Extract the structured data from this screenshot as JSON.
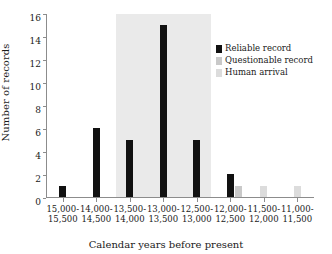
{
  "chart_data": {
    "type": "bar",
    "title": "",
    "subtitle": "",
    "xlabel": "Calendar years before present",
    "ylabel": "Number of records",
    "ylim": [
      0,
      16
    ],
    "ytick_labels": [
      "0",
      "2",
      "4",
      "6",
      "8",
      "10",
      "12",
      "14",
      "16"
    ],
    "ytick_values": [
      0,
      2,
      4,
      6,
      8,
      10,
      12,
      14,
      16
    ],
    "grid": false,
    "legend_position": "top-right",
    "categories": [
      "15,000-15,500",
      "14,000-14,500",
      "13,500-14,000",
      "13,000-13,500",
      "12,500-13,000",
      "12,000-12,500",
      "11,500-12,000",
      "11,000-11,500"
    ],
    "category_lines": [
      [
        "15,000-",
        "15,500"
      ],
      [
        "14,000-",
        "14,500"
      ],
      [
        "13,500-",
        "14,000"
      ],
      [
        "13,000-",
        "13,500"
      ],
      [
        "12,500-",
        "13,000"
      ],
      [
        "12,000-",
        "12,500"
      ],
      [
        "11,500-",
        "12,000"
      ],
      [
        "11,000-",
        "11,500"
      ]
    ],
    "series": [
      {
        "name": "Reliable record",
        "color": "#111111",
        "values": [
          1,
          6,
          5,
          15,
          5,
          2,
          0,
          0
        ]
      },
      {
        "name": "Questionable record",
        "color": "#c9c9c9",
        "values": [
          0,
          0,
          0,
          0,
          0,
          1,
          0,
          0
        ]
      },
      {
        "name": "Human arrival",
        "color": "#dcdcdc",
        "values": [
          0,
          0,
          0,
          0,
          0,
          0,
          1,
          1
        ]
      }
    ],
    "annotations": [
      {
        "name": "shaded-band",
        "kind": "vertical-band",
        "from_category": "13,500-14,000",
        "to_category": "12,500-13,000",
        "color": "#eaeaea"
      }
    ]
  },
  "legend": {
    "items": [
      {
        "label": "Reliable record",
        "swatch": "reliable"
      },
      {
        "label": "Questionable record",
        "swatch": "question"
      },
      {
        "label": "Human arrival",
        "swatch": "human"
      }
    ]
  }
}
